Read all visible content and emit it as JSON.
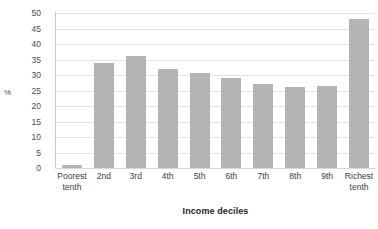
{
  "chart_data": {
    "type": "bar",
    "title": "",
    "xlabel": "Income deciles",
    "ylabel": "%",
    "categories": [
      "Poorest tenth",
      "2nd",
      "3rd",
      "4th",
      "5th",
      "6th",
      "7th",
      "8th",
      "9th",
      "Richest tenth"
    ],
    "values": [
      1,
      34,
      36,
      32,
      30.5,
      29,
      27,
      26,
      26.5,
      48
    ],
    "ylim": [
      0,
      50
    ],
    "ytick_labels": [
      "50",
      "45",
      "40",
      "35",
      "30",
      "25",
      "20",
      "15",
      "10",
      "5",
      "0"
    ],
    "ytick_values": [
      50,
      45,
      40,
      35,
      30,
      25,
      20,
      15,
      10,
      5,
      0
    ],
    "grid": true,
    "legend": "none",
    "bar_color": "#b4b4b4",
    "grid_color": "#e3e3e3",
    "axis_color": "#c9c9c9",
    "background_color": "#ffffff"
  }
}
